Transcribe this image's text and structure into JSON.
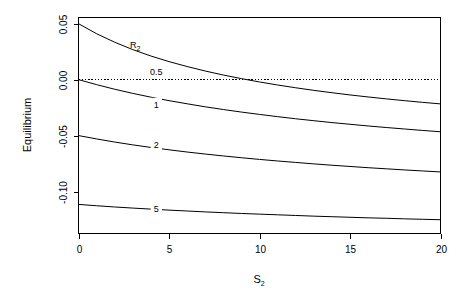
{
  "chart_data": {
    "type": "line",
    "title": "",
    "xlabel": "S2",
    "xlabel_base": "S",
    "xlabel_sub": "2",
    "ylabel": "Equilibrium",
    "xlim": [
      0,
      20
    ],
    "ylim": [
      -0.1375,
      0.0555
    ],
    "grid": false,
    "legend_position": "inline-curve-labels",
    "legend_title": "R2",
    "legend_title_base": "R",
    "legend_title_sub": "2",
    "xticks": [
      0,
      5,
      10,
      15,
      20
    ],
    "xtick_labels": [
      "0",
      "5",
      "10",
      "15",
      "20"
    ],
    "yticks": [
      0.05,
      0.0,
      -0.05,
      -0.1
    ],
    "ytick_labels": [
      "0.05",
      "0.00",
      "-0.05",
      "-0.10"
    ],
    "reference_line": {
      "name": "zero-line",
      "y": 0.0,
      "style": "dotted"
    },
    "x": [
      0,
      1,
      2,
      3,
      4,
      5,
      6,
      7,
      8,
      9,
      10,
      11,
      12,
      13,
      14,
      15,
      16,
      17,
      18,
      19,
      20
    ],
    "series": [
      {
        "name": "R2 = 0.5",
        "label": "0.5",
        "label_x": 4.3,
        "label_y": 0.0069,
        "values": [
          0.05,
          0.041,
          0.0334,
          0.0268,
          0.0211,
          0.0161,
          0.0117,
          0.0077,
          0.0041,
          0.0009,
          -0.0021,
          -0.0048,
          -0.0073,
          -0.0096,
          -0.0117,
          -0.0137,
          -0.0155,
          -0.0172,
          -0.0188,
          -0.0203,
          -0.0217
        ]
      },
      {
        "name": "R2 = 1",
        "label": "1",
        "label_x": 4.3,
        "label_y": -0.0225,
        "values": [
          0.0,
          -0.0045,
          -0.0086,
          -0.0123,
          -0.0157,
          -0.0188,
          -0.0216,
          -0.0243,
          -0.0267,
          -0.029,
          -0.0311,
          -0.0331,
          -0.035,
          -0.0367,
          -0.0384,
          -0.0399,
          -0.0414,
          -0.0428,
          -0.0441,
          -0.0454,
          -0.0466
        ]
      },
      {
        "name": "R2 = 2",
        "label": "2",
        "label_x": 4.3,
        "label_y": -0.0585,
        "values": [
          -0.05,
          -0.053,
          -0.0558,
          -0.0583,
          -0.0606,
          -0.0627,
          -0.0647,
          -0.0665,
          -0.0682,
          -0.0698,
          -0.0713,
          -0.0727,
          -0.074,
          -0.0753,
          -0.0765,
          -0.0776,
          -0.0787,
          -0.0797,
          -0.0807,
          -0.0816,
          -0.0825
        ]
      },
      {
        "name": "R2 = 5",
        "label": "5",
        "label_x": 4.3,
        "label_y": -0.1155,
        "values": [
          -0.1115,
          -0.1127,
          -0.1138,
          -0.1148,
          -0.1157,
          -0.1166,
          -0.1174,
          -0.1182,
          -0.1189,
          -0.1196,
          -0.1202,
          -0.1208,
          -0.1214,
          -0.122,
          -0.1225,
          -0.123,
          -0.1235,
          -0.1239,
          -0.1244,
          -0.1248,
          -0.1252
        ]
      }
    ]
  },
  "colors": {
    "axis": "#000000",
    "curve": "#000000",
    "background": "#ffffff"
  }
}
